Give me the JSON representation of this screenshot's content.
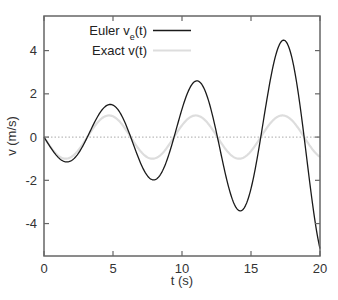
{
  "chart_data": {
    "type": "line",
    "title": "",
    "xlabel": "t (s)",
    "ylabel": "v (m/s)",
    "xlim": [
      0,
      20
    ],
    "ylim": [
      -5.5,
      5.6
    ],
    "xticks": [
      0,
      5,
      10,
      15,
      20
    ],
    "xtick_labels": [
      "0",
      "5",
      "10",
      "15",
      "20"
    ],
    "yticks": [
      -4,
      -2,
      0,
      2,
      4
    ],
    "ytick_labels": [
      "-4",
      "-2",
      "0",
      "2",
      "4"
    ],
    "grid": false,
    "zero_line": {
      "y": 0,
      "style": "dotted",
      "color": "#bbbbbb"
    },
    "legend": {
      "position": "upper-left-center",
      "entries": [
        {
          "label_main": "Euler v",
          "label_sub": "e",
          "label_tail": "(t)",
          "color": "#1a1a1a"
        },
        {
          "label_main": "Exact v(t)",
          "label_sub": "",
          "label_tail": "",
          "color": "#dddddd"
        }
      ]
    },
    "series": [
      {
        "name": "Euler v_e(t)",
        "color": "#1a1a1a",
        "model": {
          "form": "-A0*exp(g*t)*sin(w*t)",
          "A0": 1.0,
          "g": 0.0866,
          "w": 1.0
        },
        "x": [
          0,
          1.7,
          5.0,
          8.1,
          11.2,
          14.4,
          17.6,
          20
        ],
        "values": [
          0,
          -1.1,
          1.6,
          -2.15,
          3.0,
          -4.1,
          5.6,
          -5.5
        ]
      },
      {
        "name": "Exact v(t)",
        "color": "#dddddd",
        "model": {
          "form": "-A0*sin(w*t)",
          "A0": 1.0,
          "w": 1.0
        },
        "x": [
          0,
          1.57,
          4.71,
          7.85,
          11.0,
          14.1,
          17.3,
          20
        ],
        "values": [
          0,
          -1.0,
          1.0,
          -1.0,
          1.0,
          -1.0,
          1.0,
          -0.91
        ]
      }
    ]
  }
}
